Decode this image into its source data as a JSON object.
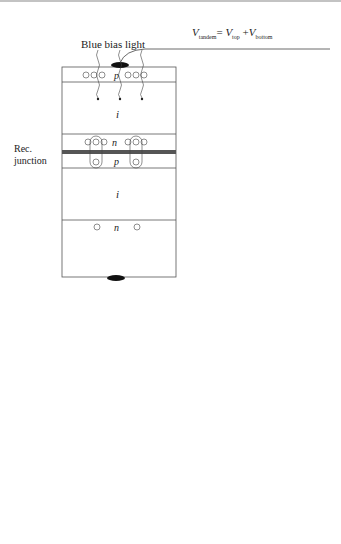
{
  "panel_a": {
    "label": "(a)",
    "equation": {
      "lhs": "V",
      "lhs_sub": "tandem",
      "eq": "= ",
      "v1": "V",
      "v1_sub": "top",
      "plus": " +",
      "v2": "V",
      "v2_sub": "bottom"
    },
    "bias_light_label": "Blue bias light",
    "rec_junction_label": [
      "Rec.",
      "junction"
    ],
    "layers": {
      "top_p": "p",
      "top_i": "i",
      "mid_n": "n",
      "mid_p": "p",
      "bottom_i": "i",
      "bottom_n": "n"
    },
    "current_label": "J",
    "v_top": {
      "v": "V",
      "sub": "top"
    },
    "v_bottom": {
      "v": "V",
      "sub": "bottom"
    },
    "v_tandem": {
      "v": "V",
      "sub": "tandem"
    },
    "plus": "+",
    "minus": "−"
  },
  "panel_b": {
    "label": "(b)",
    "equation": {
      "j": "J",
      "eq1": " = ",
      "j1": "J",
      "j1_sub": "tandem",
      "eq2": " = ",
      "j2": "J",
      "j2_sub": "top",
      "eq3": "= ",
      "j3": "J",
      "j3_sub": "bottom"
    },
    "j_top": {
      "j": "J",
      "sub": "top"
    },
    "j_bottom": {
      "j": "J",
      "sub": "bottom"
    },
    "v_top": {
      "v": "V",
      "sub": "top"
    },
    "v_bottom": {
      "v": "V",
      "sub": "bottom"
    },
    "top_curve_label": [
      "top cell",
      "under (strong)",
      "bias light"
    ],
    "bottom_am15_label": [
      "bottom",
      "cell",
      "under AM1.5"
    ],
    "bottom_weak_label": [
      "bottom",
      "cell under (weak)",
      "monochromatic",
      "probe light"
    ],
    "v1": {
      "v": "V",
      "sub": "1"
    },
    "v2": {
      "v": "V",
      "sub": "2"
    },
    "neg_v1": {
      "v": "−V",
      "sub": "1"
    }
  }
}
